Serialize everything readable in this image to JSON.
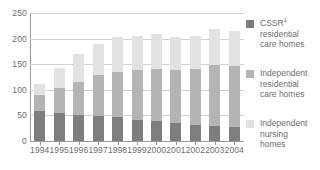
{
  "chart_data": {
    "type": "bar",
    "stacked": true,
    "title": "",
    "xlabel": "",
    "ylabel": "",
    "ylim": [
      0,
      250
    ],
    "yticks": [
      0,
      50,
      100,
      150,
      200,
      250
    ],
    "ytick_labels": [
      "0",
      "50",
      "100",
      "150",
      "200",
      "250"
    ],
    "grid": true,
    "legend_position": "right",
    "categories": [
      "1994",
      "1995",
      "1996",
      "1997",
      "1998",
      "1999",
      "2000",
      "2001",
      "2002",
      "2003",
      "2004"
    ],
    "series": [
      {
        "name": "CSSR residential care homes",
        "legend_label": "CSSR¹ residential care homes",
        "color": "#7e7e7e",
        "values": [
          59,
          55,
          51,
          48,
          46,
          42,
          39,
          36,
          31,
          29,
          28
        ]
      },
      {
        "name": "Independent residential care homes",
        "legend_label": "Independent residential care homes",
        "color": "#b4b4b4",
        "values": [
          30,
          48,
          65,
          81,
          89,
          96,
          102,
          103,
          110,
          120,
          119
        ]
      },
      {
        "name": "Independent nursing homes",
        "legend_label": "Independent nursing homes",
        "color": "#e2e2e2",
        "values": [
          23,
          39,
          53,
          61,
          68,
          67,
          68,
          64,
          65,
          70,
          68
        ]
      }
    ],
    "totals": [
      112,
      142,
      169,
      190,
      203,
      205,
      209,
      203,
      206,
      219,
      215
    ]
  },
  "legend": {
    "entries": [
      {
        "label_line1": "CSSR",
        "superscript": "1",
        "label_line2": "residential",
        "label_line3": "care homes",
        "color": "#7e7e7e"
      },
      {
        "label_line1": "Independent",
        "superscript": "",
        "label_line2": "residential",
        "label_line3": "care homes",
        "color": "#b4b4b4"
      },
      {
        "label_line1": "Independent",
        "superscript": "",
        "label_line2": "nursing",
        "label_line3": "homes",
        "color": "#e2e2e2"
      }
    ]
  },
  "axis_colors": {
    "gridline": "#d2d2d2",
    "axis": "#9a9a9a",
    "text": "#6e6e6e"
  }
}
